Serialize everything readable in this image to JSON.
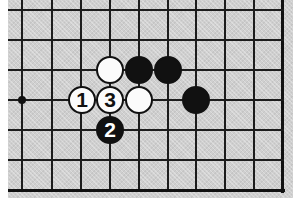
{
  "diagram": {
    "kind": "go-board-diagram",
    "title": "",
    "width": 302,
    "height": 210,
    "colors": {
      "board": "#cfcfcf",
      "line": "#1c1c1c",
      "edge": "#111111",
      "black_stone": "#111111",
      "white_stone": "#fbfbfb",
      "page": "#ffffff"
    }
  },
  "board": {
    "vertical_lines_x": [
      22,
      52,
      81,
      110,
      139,
      168,
      196,
      225,
      254,
      282
    ],
    "horizontal_lines_y": [
      10,
      40,
      70,
      100,
      130,
      160,
      190
    ],
    "right_edge_x": 282,
    "bottom_edge_y": 190,
    "grid_spacing": 29,
    "star_points": [
      {
        "name": "hoshi",
        "x": 22,
        "y": 100
      }
    ]
  },
  "stones": [
    {
      "id": "stone-white-plain-top",
      "color": "white",
      "label": "",
      "x": 110,
      "y": 70
    },
    {
      "id": "stone-black-plain-top-1",
      "color": "black",
      "label": "",
      "x": 139,
      "y": 70
    },
    {
      "id": "stone-black-plain-top-2",
      "color": "black",
      "label": "",
      "x": 168,
      "y": 70
    },
    {
      "id": "stone-move-1",
      "color": "white",
      "label": "1",
      "x": 82,
      "y": 100
    },
    {
      "id": "stone-move-3",
      "color": "white",
      "label": "3",
      "x": 110,
      "y": 100
    },
    {
      "id": "stone-white-plain-mid",
      "color": "white",
      "label": "",
      "x": 139,
      "y": 100
    },
    {
      "id": "stone-black-plain-right",
      "color": "black",
      "label": "",
      "x": 196,
      "y": 100
    },
    {
      "id": "stone-move-2",
      "color": "black",
      "label": "2",
      "x": 110,
      "y": 130
    }
  ],
  "moves": {
    "move_1": "1",
    "move_2": "2",
    "move_3": "3"
  }
}
